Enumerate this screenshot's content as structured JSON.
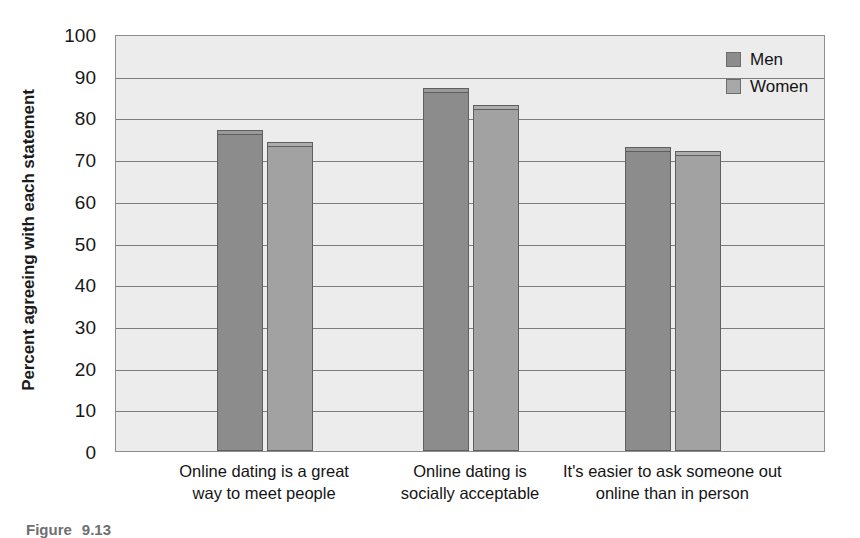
{
  "figure": {
    "caption_label": "Figure",
    "caption_number": "9.13"
  },
  "chart_data": {
    "type": "bar",
    "title": "",
    "xlabel": "",
    "ylabel": "Percent agreeing with each statement",
    "ylim": [
      0,
      100
    ],
    "ytick_step": 10,
    "yticks": [
      "100",
      "90",
      "80",
      "70",
      "60",
      "50",
      "40",
      "30",
      "20",
      "10",
      "0"
    ],
    "grid": true,
    "legend_position": "top-right",
    "categories": [
      "Online dating is a great way to meet people",
      "Online dating is socially acceptable",
      "It's easier to ask someone out online than in person"
    ],
    "category_lines": [
      [
        "Online dating is a great",
        "way to meet people"
      ],
      [
        "Online dating is",
        "socially acceptable"
      ],
      [
        "It's easier to ask someone out",
        "online than in person"
      ]
    ],
    "series": [
      {
        "name": "Men",
        "color": "#8c8c8c",
        "values": [
          77,
          87,
          73
        ]
      },
      {
        "name": "Women",
        "color": "#a8a8a8",
        "values": [
          74,
          83,
          72
        ]
      }
    ]
  }
}
